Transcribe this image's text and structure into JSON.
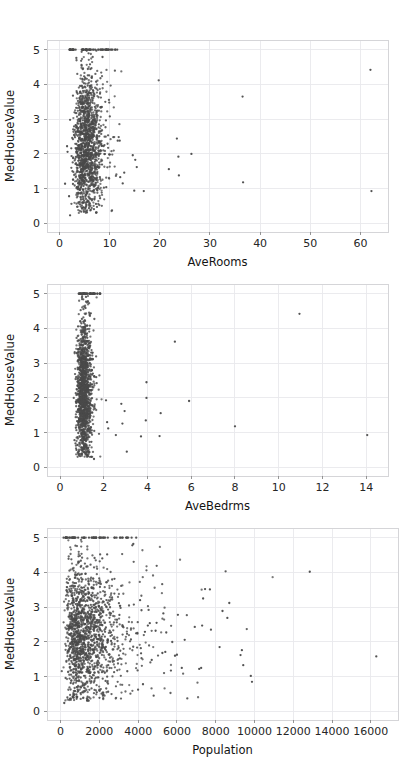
{
  "figure": {
    "background": "#ffffff",
    "width": 413,
    "height": 773,
    "point_color": "#4a4a4a",
    "grid_color": "#e9e9ec",
    "spine_color": "#d5d5d8",
    "tick_label_color": "#262626",
    "panel_count": 3
  },
  "chart_data": [
    {
      "type": "scatter",
      "title": "",
      "xlabel": "AveRooms",
      "ylabel": "MedHouseValue",
      "xlim": [
        -2.5,
        65.5
      ],
      "ylim": [
        -0.25,
        5.28
      ],
      "xticks": [
        0,
        10,
        20,
        30,
        40,
        50,
        60
      ],
      "xticklabels": [
        "0",
        "10",
        "20",
        "30",
        "40",
        "50",
        "60"
      ],
      "yticks": [
        0,
        1,
        2,
        3,
        4,
        5
      ],
      "yticklabels": [
        "0",
        "1",
        "2",
        "3",
        "4",
        "5"
      ],
      "grid": true,
      "legend": "none",
      "marker": "point",
      "marker_size": 1.6,
      "n_points": 1400,
      "cluster": {
        "x_mode": "lognormal",
        "x_median": 5.4,
        "x_sigma": 0.28,
        "y_uniform_range": [
          0.3,
          5.0
        ],
        "y_mean": 2.1,
        "note": "main cloud concentrated between AveRooms 3 and 9"
      },
      "saturation_band": {
        "y": 5.0,
        "x_range": [
          2.0,
          11.5
        ],
        "count": 52,
        "note": "MedHouseValue capped at 5.00001"
      },
      "outliers": [
        {
          "x": 62.0,
          "y": 4.42
        },
        {
          "x": 62.2,
          "y": 0.93
        },
        {
          "x": 36.5,
          "y": 3.65
        },
        {
          "x": 36.6,
          "y": 1.18
        },
        {
          "x": 23.4,
          "y": 2.44
        },
        {
          "x": 23.8,
          "y": 1.38
        },
        {
          "x": 23.7,
          "y": 1.92
        },
        {
          "x": 26.3,
          "y": 2.0
        },
        {
          "x": 21.8,
          "y": 1.56
        },
        {
          "x": 16.8,
          "y": 0.93
        },
        {
          "x": 14.9,
          "y": 0.94
        },
        {
          "x": 14.6,
          "y": 1.96
        },
        {
          "x": 15.1,
          "y": 1.83
        },
        {
          "x": 15.4,
          "y": 1.62
        },
        {
          "x": 12.1,
          "y": 1.33
        },
        {
          "x": 12.6,
          "y": 1.15
        },
        {
          "x": 12.9,
          "y": 1.46
        },
        {
          "x": 11.6,
          "y": 2.38
        },
        {
          "x": 12.0,
          "y": 2.38
        },
        {
          "x": 10.2,
          "y": 5.0
        },
        {
          "x": 11.5,
          "y": 5.0
        },
        {
          "x": 1.1,
          "y": 1.14
        },
        {
          "x": 2.1,
          "y": 0.23
        },
        {
          "x": 1.9,
          "y": 0.78
        },
        {
          "x": 1.5,
          "y": 2.22
        },
        {
          "x": 1.6,
          "y": 2.06
        }
      ]
    },
    {
      "type": "scatter",
      "title": "",
      "xlabel": "AveBedrms",
      "ylabel": "MedHouseValue",
      "xlim": [
        -0.6,
        15.0
      ],
      "ylim": [
        -0.25,
        5.28
      ],
      "xticks": [
        0,
        2,
        4,
        6,
        8,
        10,
        12,
        14
      ],
      "xticklabels": [
        "0",
        "2",
        "4",
        "6",
        "8",
        "10",
        "12",
        "14"
      ],
      "yticks": [
        0,
        1,
        2,
        3,
        4,
        5
      ],
      "yticklabels": [
        "0",
        "1",
        "2",
        "3",
        "4",
        "5"
      ],
      "grid": true,
      "legend": "none",
      "marker": "point",
      "marker_size": 1.6,
      "n_points": 1400,
      "cluster": {
        "x_mode": "lognormal",
        "x_median": 1.07,
        "x_sigma": 0.17,
        "y_uniform_range": [
          0.3,
          5.0
        ],
        "y_mean": 2.1,
        "note": "tight vertical band near AveBedrms 1.0-1.5"
      },
      "saturation_band": {
        "y": 5.0,
        "x_range": [
          0.85,
          1.85
        ],
        "count": 40,
        "note": "MedHouseValue capped at 5.00001"
      },
      "outliers": [
        {
          "x": 14.05,
          "y": 0.93
        },
        {
          "x": 10.95,
          "y": 4.42
        },
        {
          "x": 8.0,
          "y": 1.18
        },
        {
          "x": 5.9,
          "y": 1.91
        },
        {
          "x": 5.25,
          "y": 3.62
        },
        {
          "x": 4.6,
          "y": 1.56
        },
        {
          "x": 4.55,
          "y": 0.9
        },
        {
          "x": 3.95,
          "y": 2.45
        },
        {
          "x": 3.95,
          "y": 2.0
        },
        {
          "x": 3.92,
          "y": 1.35
        },
        {
          "x": 3.7,
          "y": 0.89
        },
        {
          "x": 3.05,
          "y": 0.45
        },
        {
          "x": 2.95,
          "y": 1.62
        },
        {
          "x": 2.85,
          "y": 1.26
        },
        {
          "x": 2.8,
          "y": 1.83
        },
        {
          "x": 2.55,
          "y": 0.93
        },
        {
          "x": 2.1,
          "y": 1.93
        },
        {
          "x": 2.15,
          "y": 1.3
        },
        {
          "x": 2.2,
          "y": 1.12
        },
        {
          "x": 1.55,
          "y": 0.24
        },
        {
          "x": 0.72,
          "y": 1.14
        },
        {
          "x": 0.78,
          "y": 1.33
        },
        {
          "x": 0.82,
          "y": 2.48
        },
        {
          "x": 0.75,
          "y": 0.5
        }
      ]
    },
    {
      "type": "scatter",
      "title": "",
      "xlabel": "Population",
      "ylabel": "MedHouseValue",
      "xlim": [
        -700,
        17400
      ],
      "ylim": [
        -0.25,
        5.28
      ],
      "xticks": [
        0,
        2000,
        4000,
        6000,
        8000,
        10000,
        12000,
        14000,
        16000
      ],
      "xticklabels": [
        "0",
        "2000",
        "4000",
        "6000",
        "8000",
        "10000",
        "12000",
        "14000",
        "16000"
      ],
      "yticks": [
        0,
        1,
        2,
        3,
        4,
        5
      ],
      "yticklabels": [
        "0",
        "1",
        "2",
        "3",
        "4",
        "5"
      ],
      "grid": true,
      "legend": "none",
      "marker": "point",
      "marker_size": 1.6,
      "n_points": 1500,
      "cluster": {
        "x_mode": "lognormal",
        "x_median": 1280,
        "x_sigma": 0.62,
        "y_uniform_range": [
          0.3,
          5.0
        ],
        "y_mean": 2.05,
        "note": "broad cloud from 100 to 4000 population"
      },
      "saturation_band": {
        "y": 5.0,
        "x_range": [
          150,
          3700
        ],
        "count": 48,
        "note": "MedHouseValue capped at 5.00001"
      },
      "outliers": [
        {
          "x": 16280,
          "y": 1.58
        },
        {
          "x": 12850,
          "y": 4.02
        },
        {
          "x": 9870,
          "y": 0.85
        },
        {
          "x": 9810,
          "y": 1.02
        },
        {
          "x": 9420,
          "y": 1.33
        },
        {
          "x": 9350,
          "y": 1.76
        },
        {
          "x": 9280,
          "y": 1.62
        },
        {
          "x": 8700,
          "y": 3.12
        },
        {
          "x": 8600,
          "y": 2.69
        },
        {
          "x": 8350,
          "y": 2.89
        },
        {
          "x": 8200,
          "y": 1.85
        },
        {
          "x": 7700,
          "y": 3.51
        },
        {
          "x": 7450,
          "y": 3.52
        },
        {
          "x": 7350,
          "y": 3.25
        },
        {
          "x": 7300,
          "y": 2.47
        },
        {
          "x": 7250,
          "y": 1.25
        },
        {
          "x": 7150,
          "y": 1.22
        },
        {
          "x": 6400,
          "y": 2.06
        },
        {
          "x": 6250,
          "y": 1.25
        },
        {
          "x": 6050,
          "y": 2.78
        },
        {
          "x": 6000,
          "y": 1.63
        },
        {
          "x": 5900,
          "y": 1.6
        },
        {
          "x": 5450,
          "y": 2.27
        },
        {
          "x": 5400,
          "y": 1.71
        },
        {
          "x": 5300,
          "y": 2.82
        },
        {
          "x": 5250,
          "y": 1.68
        },
        {
          "x": 4950,
          "y": 2.55
        },
        {
          "x": 4900,
          "y": 2.32
        },
        {
          "x": 4800,
          "y": 0.45
        },
        {
          "x": 4700,
          "y": 1.48
        },
        {
          "x": 4600,
          "y": 2.54
        },
        {
          "x": 4500,
          "y": 2.47
        },
        {
          "x": 4350,
          "y": 2.29
        },
        {
          "x": 4250,
          "y": 0.78
        },
        {
          "x": 4150,
          "y": 1.67
        },
        {
          "x": 4100,
          "y": 3.2
        },
        {
          "x": 3900,
          "y": 5.0
        },
        {
          "x": 3700,
          "y": 4.78
        },
        {
          "x": 3750,
          "y": 4.82
        },
        {
          "x": 190,
          "y": 0.24
        }
      ]
    }
  ]
}
